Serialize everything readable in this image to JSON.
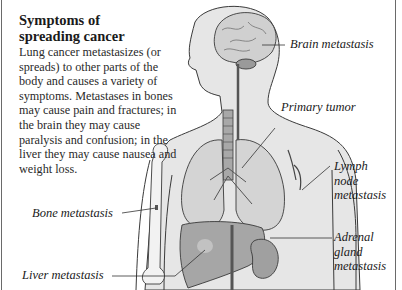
{
  "panel": {
    "title_line1": "Symptoms of",
    "title_line2": "spreading cancer",
    "body": "Lung cancer metastasizes (or spreads) to other parts of the body and causes a variety of symptoms. Metastases in bones may cause pain and fractures; in the brain they may cause paralysis and confusion; in the liver they may cause nausea and weight loss."
  },
  "labels": {
    "brain": "Brain metastasis",
    "primary": "Primary tumor",
    "lymph": [
      "Lymph",
      "node",
      "metastasis"
    ],
    "bone": "Bone metastasis",
    "adrenal": [
      "Adrenal",
      "gland",
      "metastasis"
    ],
    "liver": "Liver metastasis"
  },
  "colors": {
    "skin": "#e4e4e4",
    "outline": "#3a3a3a",
    "organ": "#b8b8b8",
    "lung": "#d2d2d2",
    "bone": "#f2f2f2",
    "leader": "#333333"
  }
}
